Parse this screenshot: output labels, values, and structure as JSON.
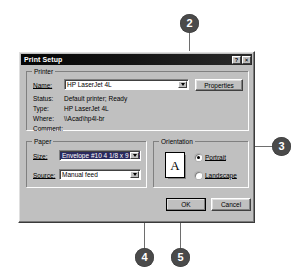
{
  "window": {
    "title": "Print Setup",
    "help_button": "?",
    "close_button": "✕"
  },
  "printer_group": {
    "legend": "Printer",
    "name_label": "Name:",
    "name_value": "HP LaserJet 4L",
    "properties_button": "Properties",
    "status_label": "Status:",
    "status_value": "Default printer; Ready",
    "type_label": "Type:",
    "type_value": "HP LaserJet 4L",
    "where_label": "Where:",
    "where_value": "\\\\Acad\\hp4l-br",
    "comment_label": "Comment:",
    "comment_value": ""
  },
  "paper_group": {
    "legend": "Paper",
    "size_label": "Size:",
    "size_value": "Envelope #10 4 1/8 x 9 1/2 in",
    "source_label": "Source:",
    "source_value": "Manual feed"
  },
  "orientation_group": {
    "legend": "Orientation",
    "preview_glyph": "A",
    "portrait_label": "Portrait",
    "landscape_label": "Landscape",
    "selected": "Portrait"
  },
  "buttons": {
    "ok": "OK",
    "cancel": "Cancel"
  },
  "callouts": [
    {
      "number": "2",
      "target": "printer-name-dropdown-arrow"
    },
    {
      "number": "3",
      "target": "orientation-group"
    },
    {
      "number": "4",
      "target": "paper-size-dropdown-arrow"
    },
    {
      "number": "5",
      "target": "ok-button"
    }
  ],
  "colors": {
    "dialog_face": "#c0c0c0",
    "titlebar": "#0b0b0b",
    "callout_fill": "#4a4a4a",
    "callout_text": "#ffffff",
    "selection": "#2a2a5e",
    "page_background": "#ffffff"
  }
}
